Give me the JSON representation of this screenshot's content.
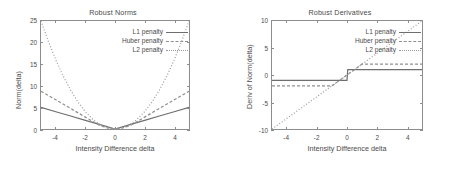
{
  "figure": {
    "background": "#ffffff",
    "axis_color": "#8d8d8d",
    "text_color": "#4a4a4a"
  },
  "chart_data": [
    {
      "type": "line",
      "id": "robust-norms",
      "title": "Robust Norms",
      "xlabel": "Intensity Difference delta",
      "ylabel": "Norm(delta)",
      "xlim": [
        -5,
        5
      ],
      "ylim": [
        0,
        25
      ],
      "xticks": [
        -4,
        -2,
        0,
        2,
        4
      ],
      "yticks": [
        0,
        5,
        10,
        15,
        20,
        25
      ],
      "grid": false,
      "legend_position": "top-right",
      "series": [
        {
          "name": "L1 penalty",
          "style": "solid",
          "color": "#6e6e6e",
          "x": [
            -5,
            -4,
            -3,
            -2,
            -1,
            0,
            1,
            2,
            3,
            4,
            5
          ],
          "values": [
            5,
            4,
            3,
            2,
            1,
            0,
            1,
            2,
            3,
            4,
            5
          ]
        },
        {
          "name": "Huber penalty",
          "style": "dashed",
          "color": "#8f8f8f",
          "x": [
            -5,
            -4,
            -3,
            -2,
            -1,
            -0.5,
            0,
            0.5,
            1,
            2,
            3,
            4,
            5
          ],
          "values": [
            8.75,
            6.75,
            4.75,
            2.75,
            0.75,
            0.25,
            0,
            0.25,
            0.75,
            2.75,
            4.75,
            6.75,
            8.75
          ]
        },
        {
          "name": "L2 penalty",
          "style": "dotted",
          "color": "#9a9a9a",
          "x": [
            -5,
            -4.5,
            -4,
            -3.5,
            -3,
            -2.5,
            -2,
            -1.5,
            -1,
            -0.5,
            0,
            0.5,
            1,
            1.5,
            2,
            2.5,
            3,
            3.5,
            4,
            4.5,
            5
          ],
          "values": [
            25,
            20.25,
            16,
            12.25,
            9,
            6.25,
            4,
            2.25,
            1,
            0.25,
            0,
            0.25,
            1,
            2.25,
            4,
            6.25,
            9,
            12.25,
            16,
            20.25,
            25
          ]
        }
      ]
    },
    {
      "type": "line",
      "id": "robust-derivatives",
      "title": "Robust Derivatives",
      "xlabel": "Intensity Difference delta",
      "ylabel": "Deriv of Norm(delta)",
      "xlim": [
        -5,
        5
      ],
      "ylim": [
        -10,
        10
      ],
      "xticks": [
        -4,
        -2,
        0,
        2,
        4
      ],
      "yticks": [
        -10,
        -5,
        0,
        5,
        10
      ],
      "grid": false,
      "legend_position": "top-right",
      "series": [
        {
          "name": "L1 penalty",
          "style": "solid",
          "color": "#6e6e6e",
          "x": [
            -5,
            -0.05,
            0,
            0.05,
            5
          ],
          "values": [
            -1,
            -1,
            -1,
            1,
            1
          ]
        },
        {
          "name": "Huber penalty",
          "style": "dashed",
          "color": "#8f8f8f",
          "x": [
            -5,
            -1,
            0,
            1,
            5
          ],
          "values": [
            -2,
            -2,
            0,
            2,
            2
          ]
        },
        {
          "name": "L2 penalty",
          "style": "dotted",
          "color": "#9a9a9a",
          "x": [
            -5,
            0,
            5
          ],
          "values": [
            -10,
            0,
            10
          ]
        }
      ]
    }
  ],
  "panels": {
    "left": {
      "title": "Robust Norms",
      "xlabel": "Intensity Difference delta",
      "ylabel": "Norm(delta)",
      "xticks": [
        "-4",
        "-2",
        "0",
        "2",
        "4"
      ],
      "yticks": [
        "0",
        "5",
        "10",
        "15",
        "20",
        "25"
      ],
      "legend": [
        {
          "label": "L1 penalty",
          "style": "solid"
        },
        {
          "label": "Huber penalty",
          "style": "dashed"
        },
        {
          "label": "L2 penalty",
          "style": "dotted"
        }
      ]
    },
    "right": {
      "title": "Robust Derivatives",
      "xlabel": "Intensity Difference delta",
      "ylabel": "Deriv of Norm(delta)",
      "xticks": [
        "-4",
        "-2",
        "0",
        "2",
        "4"
      ],
      "yticks": [
        "-10",
        "-5",
        "0",
        "5",
        "10"
      ],
      "legend": [
        {
          "label": "L1 penalty",
          "style": "solid"
        },
        {
          "label": "Huber penalty",
          "style": "dashed"
        },
        {
          "label": "L2 penalty",
          "style": "dotted"
        }
      ]
    }
  }
}
